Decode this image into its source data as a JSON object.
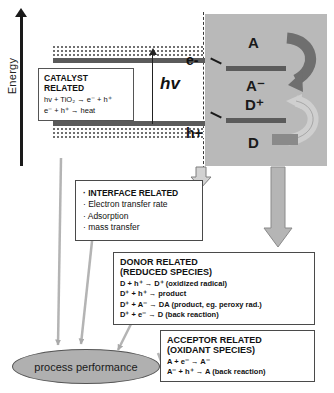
{
  "diagram": {
    "axis": {
      "label": "Energy"
    },
    "band": {
      "photon_label": "hv",
      "electron_label": "e-",
      "hole_label": "h+"
    },
    "catalyst_box": {
      "title": "CATALYST RELATED",
      "equations": [
        "hv + TiO₂ → e⁻ + h⁺",
        "e⁻ + h⁺ → heat"
      ]
    },
    "reaction_panel": {
      "species": [
        {
          "id": "acceptor",
          "label": "A"
        },
        {
          "id": "acceptor-radical",
          "label": "A⁻"
        },
        {
          "id": "donor-cation",
          "label": "D⁺"
        },
        {
          "id": "donor",
          "label": "D"
        }
      ]
    },
    "interface_box": {
      "lines": [
        "· INTERFACE RELATED",
        "· Electron transfer rate",
        "· Adsorption",
        "· mass transfer"
      ]
    },
    "donor_box": {
      "title": "DONOR  RELATED",
      "subtitle": "(REDUCED SPECIES)",
      "reactions": [
        "D + h⁺ → D⁺ (oxidized radical)",
        "D⁺ + h⁺ →  product",
        "D⁺ + A⁻ →  DA  (product, eg. peroxy rad.)",
        "D⁺ +  e⁻ → D (back reaction)"
      ]
    },
    "acceptor_box": {
      "title": "ACCEPTOR RELATED",
      "subtitle": "(OXIDANT SPECIES)",
      "reactions": [
        "A + e⁻  → A⁻",
        "A⁻ + h⁺ →  A (back reaction)"
      ]
    },
    "outcome": {
      "label": "process performance"
    },
    "colors": {
      "panel_gray": "#b9b9b9",
      "band_gray": "#5b5b5b",
      "arrow_gray": "#a8a8a8",
      "ellipse_gray": "#b0b0b0",
      "ink": "#1a1a1a"
    }
  }
}
